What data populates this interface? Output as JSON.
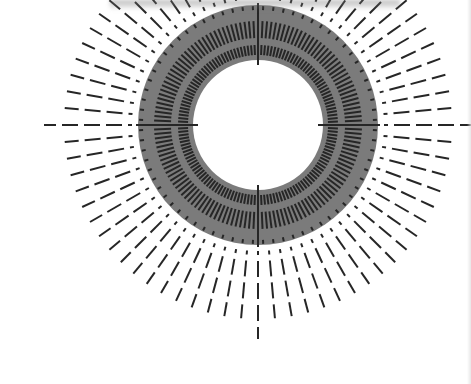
{
  "figure": {
    "center": [
      258,
      125
    ],
    "colors": {
      "background": "#ffffff",
      "annulus": "#7b7b7b",
      "dash": "#262626",
      "hole": "#ffffff"
    },
    "annulus": {
      "inner_radius": 65,
      "outer_radius": 120
    },
    "inner_bands": {
      "angle_step_deg": 2.5,
      "bands": [
        {
          "r0": 70,
          "r1": 80
        },
        {
          "r0": 87,
          "r1": 104
        }
      ]
    },
    "edge_ticks": {
      "angle_step_deg": 5,
      "r0": 115,
      "r1": 119
    },
    "outer_rays": {
      "angle_step_deg": 5,
      "dashes": [
        {
          "r0": 126,
          "r1": 130
        },
        {
          "r0": 136,
          "r1": 152
        },
        {
          "r0": 158,
          "r1": 174
        },
        {
          "r0": 180,
          "r1": 194
        }
      ]
    },
    "axis_rays": {
      "angles_deg": [
        0,
        90,
        180,
        270
      ],
      "dashes": [
        {
          "r0": 126,
          "r1": 130
        },
        {
          "r0": 136,
          "r1": 152
        },
        {
          "r0": 158,
          "r1": 174
        },
        {
          "r0": 180,
          "r1": 196
        },
        {
          "r0": 202,
          "r1": 214
        }
      ]
    }
  }
}
